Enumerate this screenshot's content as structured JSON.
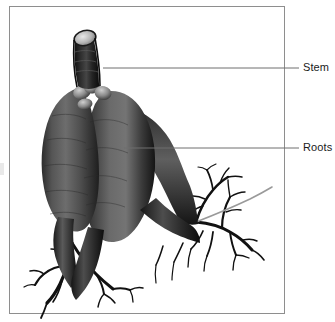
{
  "figure": {
    "frame": {
      "border_color": "#8e8e8e",
      "background_color": "#ffffff",
      "x": 9,
      "y": 6,
      "width": 275,
      "height": 307
    },
    "palette": {
      "ink_dark": "#141414",
      "ink_mid": "#4a4a4a",
      "ink_light": "#8f8f8f",
      "highlight": "#d8d8d8",
      "leader_line": "#6e6e6e",
      "label_text": "#1a1a1a",
      "canvas": "#ffffff"
    },
    "labels": [
      {
        "id": "stem",
        "text": "Stem",
        "x": 303,
        "y": 61,
        "leader": {
          "x1": 103,
          "y1": 68,
          "x2": 299,
          "y2": 68
        }
      },
      {
        "id": "roots",
        "text": "Roots",
        "x": 303,
        "y": 141,
        "leader": {
          "x1": 124,
          "y1": 148,
          "x2": 299,
          "y2": 148
        }
      }
    ]
  }
}
